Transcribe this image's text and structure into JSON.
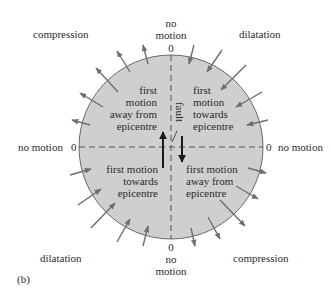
{
  "figure": {
    "panel_label": "(b)",
    "colors": {
      "disc_fill": "#cfcfcf",
      "disc_stroke": "#6a6a6a",
      "arrow": "#6e6e6e",
      "text": "#2a2a2a",
      "dash": "#555555",
      "fault_arrow": "#1a1a1a"
    },
    "quadrant_labels": {
      "top_left": "compression",
      "top_right": "dilatation",
      "bottom_left": "dilatation",
      "bottom_right": "compression"
    },
    "axis_labels": {
      "top": {
        "line1": "no",
        "line2": "motion",
        "zero": "0"
      },
      "bottom": {
        "line1": "no",
        "line2": "motion",
        "zero": "0"
      },
      "left": {
        "text": "no motion",
        "zero": "0"
      },
      "right": {
        "text": "no motion",
        "zero": "0"
      }
    },
    "inner_text": {
      "top_left": [
        "first",
        "motion",
        "away from",
        "epicentre"
      ],
      "top_right": [
        "first",
        "motion",
        "towards",
        "epicentre"
      ],
      "bottom_left": [
        "first motion",
        "towards",
        "epicentre"
      ],
      "bottom_right": [
        "first motion",
        "away from",
        "epicentre"
      ]
    },
    "fault_label": "fault"
  }
}
